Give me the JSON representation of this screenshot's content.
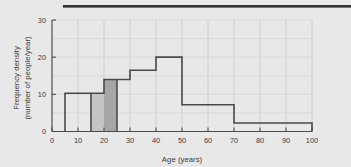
{
  "figure": {
    "top_rule": "horizontal-rule",
    "background_color": "#e8e8e8"
  },
  "chart_data": {
    "type": "bar",
    "title": "",
    "subtitle": "",
    "xlabel": "Age (years)",
    "ylabel": "Frequency density\n(number of people/year)",
    "ylabel_line1": "Frequency density",
    "ylabel_line2": "(number of people/year)",
    "xlim": [
      0,
      100
    ],
    "ylim": [
      0,
      30
    ],
    "xticks": [
      0,
      10,
      20,
      30,
      40,
      50,
      60,
      70,
      80,
      90,
      100
    ],
    "yticks": [
      0,
      10,
      20,
      30
    ],
    "xticklabels": [
      "0",
      "10",
      "20",
      "30",
      "40",
      "50",
      "60",
      "70",
      "80",
      "90",
      "100"
    ],
    "yticklabels": [
      "0",
      "10",
      "20",
      "30"
    ],
    "grid": true,
    "grid_x_step": 10,
    "grid_y_step": 5,
    "legend": "none",
    "bar_edge_color": "#4a4a4a",
    "bar_fill_color": "none",
    "bins": [
      {
        "x0": 5,
        "x1": 15,
        "value": 10.3,
        "label": "5-15"
      },
      {
        "x0": 15,
        "x1": 20,
        "value": 10.3,
        "label": "15-20"
      },
      {
        "x0": 20,
        "x1": 25,
        "value": 14.0,
        "label": "20-25"
      },
      {
        "x0": 25,
        "x1": 30,
        "value": 14.0,
        "label": "25-30"
      },
      {
        "x0": 30,
        "x1": 40,
        "value": 16.5,
        "label": "30-40"
      },
      {
        "x0": 40,
        "x1": 50,
        "value": 20.0,
        "label": "40-50"
      },
      {
        "x0": 50,
        "x1": 70,
        "value": 7.2,
        "label": "50-70"
      },
      {
        "x0": 70,
        "x1": 100,
        "value": 2.3,
        "label": "70-100"
      }
    ],
    "shaded_regions": [
      {
        "x0": 15,
        "x1": 20,
        "value": 10.3,
        "color": "#c4c4c4",
        "name": "light-shaded-band-15-20"
      },
      {
        "x0": 20,
        "x1": 25,
        "value": 14.0,
        "color": "#a6a6a6",
        "name": "dark-shaded-band-20-25"
      }
    ]
  }
}
